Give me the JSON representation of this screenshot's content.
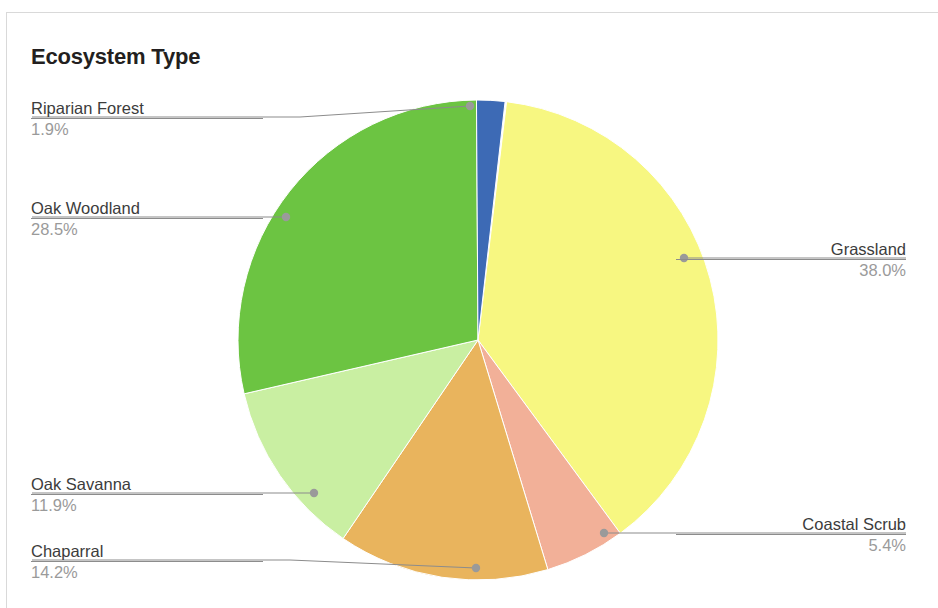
{
  "chart_title": "Ecosystem Type",
  "chart_data": {
    "type": "pie",
    "title": "Ecosystem Type",
    "xlabel": "",
    "ylabel": "",
    "legend_position": "callout-labels",
    "grid": false,
    "categories": [
      "Grassland",
      "Coastal Scrub",
      "Chaparral",
      "Oak Savanna",
      "Oak Woodland",
      "Riparian Forest"
    ],
    "values": [
      38.0,
      5.4,
      14.2,
      11.9,
      28.5,
      1.9
    ],
    "value_labels": [
      "38.0%",
      "5.4%",
      "14.2%",
      "11.9%",
      "28.5%",
      "1.9%"
    ],
    "colors": [
      "#F7F781",
      "#F2B098",
      "#E9B45D",
      "#C9EFA2",
      "#6CC442",
      "#3D6AB5"
    ],
    "slices": [
      {
        "name": "Grassland",
        "value": 38.0,
        "percent_label": "38.0%",
        "color": "#F7F781",
        "start_angle": 6.84,
        "end_angle": 143.64,
        "label_side": "right",
        "dot": {
          "x": 684,
          "y": 258
        }
      },
      {
        "name": "Coastal Scrub",
        "value": 5.4,
        "percent_label": "5.4%",
        "color": "#F2B098",
        "start_angle": 143.64,
        "end_angle": 163.08,
        "label_side": "right",
        "dot": {
          "x": 604,
          "y": 533
        }
      },
      {
        "name": "Chaparral",
        "value": 14.2,
        "percent_label": "14.2%",
        "color": "#E9B45D",
        "start_angle": 163.08,
        "end_angle": 214.2,
        "label_side": "left",
        "dot": {
          "x": 476,
          "y": 568
        }
      },
      {
        "name": "Oak Savanna",
        "value": 11.9,
        "percent_label": "11.9%",
        "color": "#C9EFA2",
        "start_angle": 214.2,
        "end_angle": 257.04,
        "label_side": "left",
        "dot": {
          "x": 314,
          "y": 493
        }
      },
      {
        "name": "Oak Woodland",
        "value": 28.5,
        "percent_label": "28.5%",
        "color": "#6CC442",
        "start_angle": 257.04,
        "end_angle": 359.64,
        "label_side": "left",
        "dot": {
          "x": 286,
          "y": 217
        }
      },
      {
        "name": "Riparian Forest",
        "value": 1.9,
        "percent_label": "1.9%",
        "color": "#3D6AB5",
        "start_angle": 359.64,
        "end_angle": 366.48,
        "label_side": "left",
        "dot": {
          "x": 470,
          "y": 106
        }
      }
    ],
    "geometry": {
      "cx": 478,
      "cy": 340,
      "r": 240
    }
  },
  "labels": {
    "riparian_forest": {
      "name": "Riparian Forest",
      "pct": "1.9%"
    },
    "oak_woodland": {
      "name": "Oak Woodland",
      "pct": "28.5%"
    },
    "oak_savanna": {
      "name": "Oak Savanna",
      "pct": "11.9%"
    },
    "chaparral": {
      "name": "Chaparral",
      "pct": "14.2%"
    },
    "grassland": {
      "name": "Grassland",
      "pct": "38.0%"
    },
    "coastal_scrub": {
      "name": "Coastal Scrub",
      "pct": "5.4%"
    }
  }
}
